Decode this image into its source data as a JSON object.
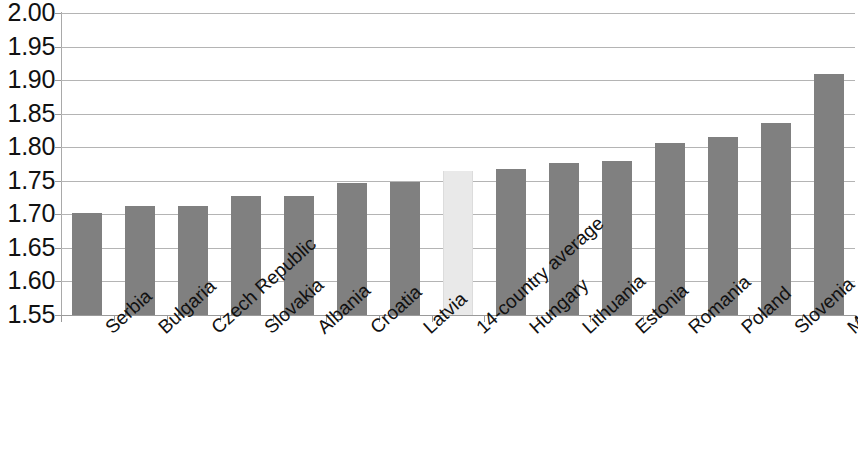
{
  "chart_data": {
    "type": "bar",
    "title": "",
    "subtitle": "",
    "xlabel": "",
    "ylabel": "",
    "ylim": [
      1.55,
      2.0
    ],
    "ytick_step": 0.05,
    "grid": true,
    "legend": "none",
    "yticks": [
      "2.00",
      "1.95",
      "1.90",
      "1.85",
      "1.80",
      "1.75",
      "1.70",
      "1.65",
      "1.60",
      "1.55"
    ],
    "ytick_values": [
      2.0,
      1.95,
      1.9,
      1.85,
      1.8,
      1.75,
      1.7,
      1.65,
      1.6,
      1.55
    ],
    "categories": [
      "Serbia",
      "Bulgaria",
      "Czech Republic",
      "Slovakia",
      "Albania",
      "Croatia",
      "Latvia",
      "14-country average",
      "Hungary",
      "Lithuania",
      "Estonia",
      "Romania",
      "Poland",
      "Slovenia",
      "Macedonia"
    ],
    "values": [
      1.702,
      1.712,
      1.712,
      1.728,
      1.727,
      1.747,
      1.748,
      1.765,
      1.768,
      1.777,
      1.779,
      1.807,
      1.815,
      1.836,
      1.909
    ],
    "highlight_category": "14-country average",
    "highlight_index": 7,
    "colors": {
      "bar": "#808080",
      "highlight_bar": "#e9e9e9",
      "gridline": "#b4b4b4",
      "axis": "#9a9a9a",
      "text": "#111111",
      "background": "#ffffff"
    }
  }
}
